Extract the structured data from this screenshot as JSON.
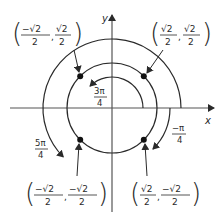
{
  "diagram": {
    "axes": {
      "x_label": "x",
      "y_label": "y"
    },
    "points": [
      {
        "id": "q1",
        "angle": "π/4",
        "x_num": "√2",
        "x_den": "2",
        "x_sign": "",
        "y_num": "√2",
        "y_den": "2",
        "y_sign": ""
      },
      {
        "id": "q2",
        "angle": "3π/4",
        "x_num": "√2",
        "x_den": "2",
        "x_sign": "−",
        "y_num": "√2",
        "y_den": "2",
        "y_sign": ""
      },
      {
        "id": "q3",
        "angle": "5π/4",
        "x_num": "√2",
        "x_den": "2",
        "x_sign": "−",
        "y_num": "√2",
        "y_den": "2",
        "y_sign": "−"
      },
      {
        "id": "q4",
        "angle": "−π/4",
        "x_num": "√2",
        "x_den": "2",
        "x_sign": "",
        "y_num": "√2",
        "y_den": "2",
        "y_sign": "−"
      }
    ],
    "arc_labels": [
      {
        "id": "arc-3pi4",
        "num": "3π",
        "den": "4"
      },
      {
        "id": "arc-5pi4",
        "num": "5π",
        "den": "4"
      },
      {
        "id": "arc-neg-pi4",
        "num": "−π",
        "den": "4"
      }
    ],
    "colors": {
      "stroke": "#2a2a2a",
      "background": "#ffffff"
    }
  }
}
